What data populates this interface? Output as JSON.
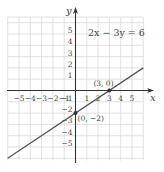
{
  "chart_data": {
    "type": "line",
    "title": "",
    "equation": "2x − 3y = 6",
    "xlabel": "x",
    "ylabel": "y",
    "xlim": [
      -6,
      6
    ],
    "ylim": [
      -6,
      6
    ],
    "grid": true,
    "x_ticks": [
      -5,
      -4,
      -3,
      -2,
      -1,
      1,
      2,
      3,
      4,
      5
    ],
    "x_tick_labels": [
      "−5",
      "−4",
      "−3",
      "−2",
      "−1",
      "1",
      "2",
      "3",
      "4",
      "5"
    ],
    "y_ticks": [
      5,
      4,
      3,
      2,
      1,
      -1,
      -2,
      -3,
      -4,
      -5
    ],
    "y_tick_labels": [
      "5",
      "4",
      "3",
      "2",
      "1",
      "−1",
      "−2",
      "−3",
      "−4",
      "−5"
    ],
    "series": [
      {
        "name": "2x − 3y = 6",
        "x": [
          -6,
          6
        ],
        "y": [
          -6,
          2
        ],
        "color": "#555555"
      }
    ],
    "points": [
      {
        "x": 3,
        "y": 0,
        "label": "(3, 0)"
      },
      {
        "x": 0,
        "y": -2,
        "label": "(0, −2)"
      }
    ]
  },
  "colors": {
    "grid": "#d4d4d4",
    "axis": "#333333",
    "line": "#555555",
    "text": "#444444"
  }
}
